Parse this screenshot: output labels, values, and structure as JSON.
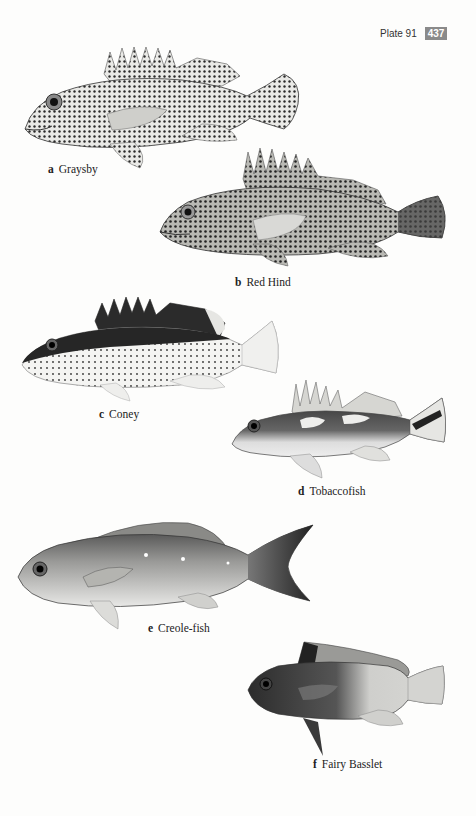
{
  "header": {
    "plate_label": "Plate 91",
    "page_number": "437"
  },
  "plates": [
    {
      "letter": "a",
      "name": "Graysby"
    },
    {
      "letter": "b",
      "name": "Red Hind"
    },
    {
      "letter": "c",
      "name": "Coney"
    },
    {
      "letter": "d",
      "name": "Tobaccofish"
    },
    {
      "letter": "e",
      "name": "Creole-fish"
    },
    {
      "letter": "f",
      "name": "Fairy Basslet"
    }
  ],
  "colors": {
    "page_background": "#fdfdfc",
    "page_number_badge": "#8a8a8a",
    "text": "#222222"
  }
}
